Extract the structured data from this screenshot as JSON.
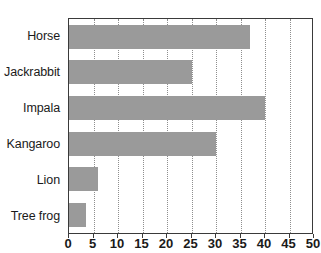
{
  "chart_data": {
    "type": "bar",
    "orientation": "horizontal",
    "title": "",
    "xlabel": "",
    "ylabel": "",
    "categories": [
      "Horse",
      "Jackrabbit",
      "Impala",
      "Kangaroo",
      "Lion",
      "Tree frog"
    ],
    "values": [
      37,
      25,
      40,
      30,
      6,
      3.5
    ],
    "series": [
      {
        "name": "",
        "values": [
          37,
          25,
          40,
          30,
          6,
          3.5
        ]
      }
    ],
    "xlim": [
      0,
      50
    ],
    "xticks": [
      0,
      5,
      10,
      15,
      20,
      25,
      30,
      35,
      40,
      45,
      50
    ],
    "xtick_labels": [
      "0",
      "5",
      "10",
      "15",
      "20",
      "25",
      "30",
      "35",
      "40",
      "45",
      "50"
    ],
    "grid": true,
    "grid_axis": "x",
    "grid_style": "dotted",
    "legend": false,
    "legend_position": "none",
    "bar_color": "#9a9a9a",
    "grid_color": "#8e8e8e",
    "axis_color": "#3a3a3a",
    "background_color": "#ffffff",
    "text_color": "#1a1a1a"
  }
}
